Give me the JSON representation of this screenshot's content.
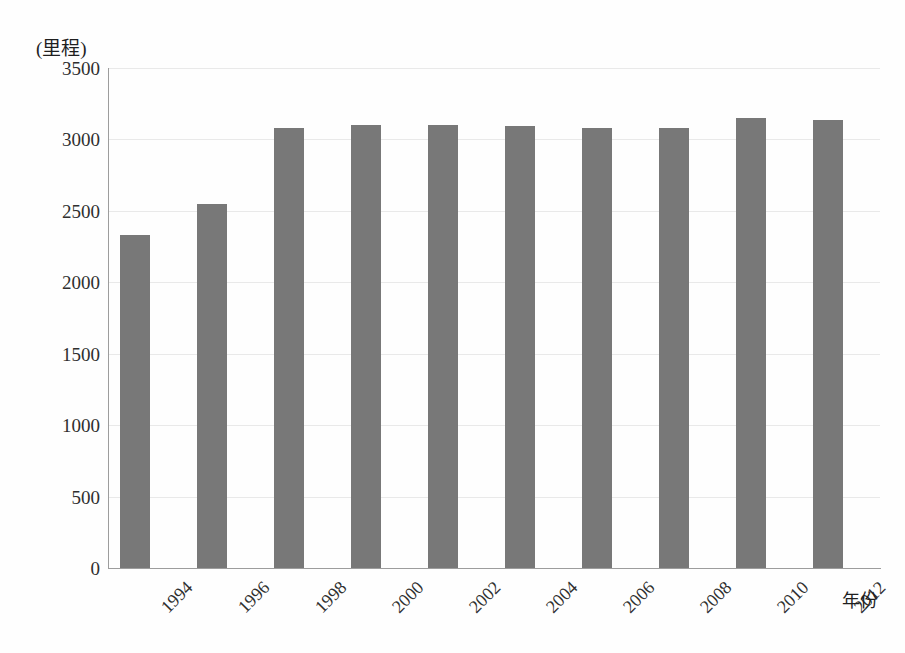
{
  "chart_data": {
    "type": "bar",
    "title": "",
    "subtitle": "",
    "xlabel": "年份",
    "ylabel": "(里程)",
    "categories": [
      "1994",
      "1996",
      "1998",
      "2000",
      "2002",
      "2004",
      "2006",
      "2008",
      "2010",
      "2012"
    ],
    "values": [
      2330,
      2550,
      3080,
      3100,
      3100,
      3095,
      3080,
      3080,
      3150,
      3135
    ],
    "series": [
      {
        "name": "里程",
        "values": [
          2330,
          2550,
          3080,
          3100,
          3100,
          3095,
          3080,
          3080,
          3150,
          3135
        ]
      }
    ],
    "ylim": [
      0,
      3500
    ],
    "y_ticks": [
      0,
      500,
      1000,
      1500,
      2000,
      2500,
      3000,
      3500
    ],
    "y_tick_labels": [
      "0",
      "500",
      "1000",
      "1500",
      "2000",
      "2500",
      "3000",
      "3500"
    ],
    "grid": "horizontal",
    "legend": "none",
    "legend_position": "none",
    "bar_color": "#787878",
    "gridline_color": "#e9e9e9",
    "axis_color": "#9d9d9d",
    "background_color": "#ffffff",
    "annotations": []
  }
}
